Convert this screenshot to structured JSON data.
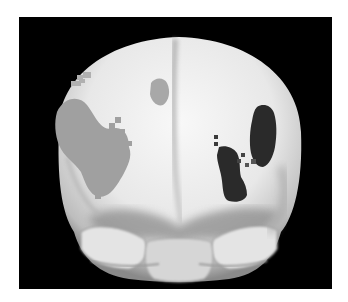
{
  "figure": {
    "background_color": "#000000",
    "page_background": "#ffffff",
    "surface_color": "#e6e6e6",
    "activations": [
      {
        "name": "left-lateral-frontal-cluster",
        "shade": "light-gray",
        "color": "#a0a0a0"
      },
      {
        "name": "left-superior-small-cluster",
        "shade": "light-gray",
        "color": "#b0b0b0"
      },
      {
        "name": "medial-superior-cluster",
        "shade": "light-gray",
        "color": "#a8a8a8"
      },
      {
        "name": "right-lateral-upper-cluster",
        "shade": "dark",
        "color": "#2a2a2a"
      },
      {
        "name": "right-lateral-lower-cluster",
        "shade": "dark",
        "color": "#2a2a2a"
      }
    ]
  }
}
